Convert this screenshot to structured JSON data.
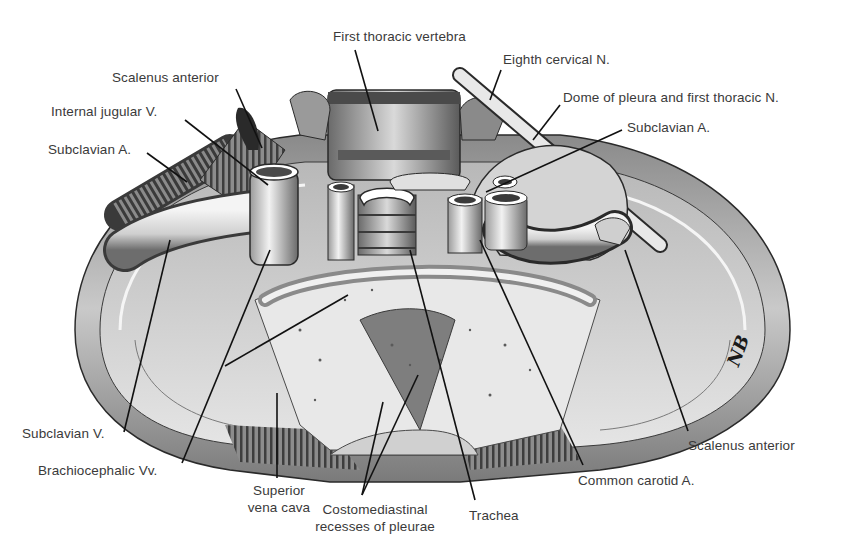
{
  "figure": {
    "signature": "NB",
    "colors": {
      "ink": "#1a1a1a",
      "label_text": "#3a3a3a",
      "shade_dark": "#555555",
      "shade_mid": "#9a9a9a",
      "shade_light": "#d8d8d8",
      "background": "#ffffff"
    }
  },
  "labels": {
    "first_thoracic_vertebra": "First thoracic vertebra",
    "eighth_cervical_n": "Eighth cervical N.",
    "dome_of_pleura": "Dome of pleura and first thoracic N.",
    "subclavian_a_right": "Subclavian A.",
    "scalenus_anterior_left": "Scalenus anterior",
    "internal_jugular_v": "Internal jugular V.",
    "subclavian_a_left": "Subclavian A.",
    "subclavian_v": "Subclavian V.",
    "brachiocephalic_vv": "Brachiocephalic Vv.",
    "superior_vena_cava_line1": "Superior",
    "superior_vena_cava_line2": "vena cava",
    "costomediastinal_line1": "Costomediastinal",
    "costomediastinal_line2": "recesses of pleurae",
    "trachea": "Trachea",
    "common_carotid_a": "Common carotid A.",
    "scalenus_anterior_right": "Scalenus anterior"
  },
  "leader_lines": [
    {
      "name": "first-thoracic-vertebra",
      "x1": 355,
      "y1": 50,
      "x2": 378,
      "y2": 131
    },
    {
      "name": "eighth-cervical-n",
      "x1": 501,
      "y1": 70,
      "x2": 490,
      "y2": 100
    },
    {
      "name": "dome-of-pleura",
      "x1": 560,
      "y1": 105,
      "x2": 533,
      "y2": 140
    },
    {
      "name": "subclavian-a-right",
      "x1": 622,
      "y1": 130,
      "x2": 486,
      "y2": 192
    },
    {
      "name": "scalenus-anterior-left",
      "x1": 236,
      "y1": 89,
      "x2": 262,
      "y2": 148
    },
    {
      "name": "internal-jugular-v",
      "x1": 185,
      "y1": 120,
      "x2": 268,
      "y2": 185
    },
    {
      "name": "subclavian-a-left",
      "x1": 147,
      "y1": 153,
      "x2": 187,
      "y2": 182
    },
    {
      "name": "subclavian-v",
      "x1": 124,
      "y1": 432,
      "x2": 170,
      "y2": 240
    },
    {
      "name": "brachiocephalic-vv",
      "x1": 182,
      "y1": 463,
      "x2": 270,
      "y2": 250
    },
    {
      "name": "brachiocephalic-vv-branch",
      "x1": 225,
      "y1": 366,
      "x2": 348,
      "y2": 295
    },
    {
      "name": "superior-vena-cava",
      "x1": 277,
      "y1": 478,
      "x2": 277,
      "y2": 393
    },
    {
      "name": "costomediastinal-a",
      "x1": 362,
      "y1": 495,
      "x2": 383,
      "y2": 402
    },
    {
      "name": "costomediastinal-b",
      "x1": 362,
      "y1": 495,
      "x2": 418,
      "y2": 375
    },
    {
      "name": "trachea",
      "x1": 475,
      "y1": 500,
      "x2": 410,
      "y2": 250
    },
    {
      "name": "common-carotid-a",
      "x1": 583,
      "y1": 465,
      "x2": 480,
      "y2": 240
    },
    {
      "name": "scalenus-anterior-right",
      "x1": 688,
      "y1": 431,
      "x2": 625,
      "y2": 250
    }
  ]
}
